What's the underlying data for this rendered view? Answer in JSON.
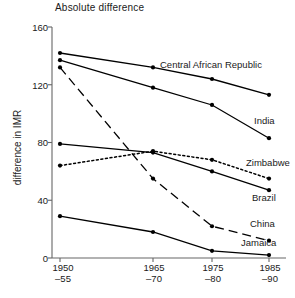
{
  "chart_data": {
    "type": "line",
    "title": "Absolute difference",
    "xlabel": "",
    "ylabel": "difference in IMR",
    "categories": [
      "1950–55",
      "1965–70",
      "1975–80",
      "1985–90"
    ],
    "category_lines": [
      [
        "1950",
        "–55"
      ],
      [
        "1965",
        "–70"
      ],
      [
        "1975",
        "–80"
      ],
      [
        "1985",
        "–90"
      ]
    ],
    "ylim": [
      0,
      160
    ],
    "yticks": [
      0,
      40,
      80,
      120,
      160
    ],
    "ytick_labels": [
      "0",
      "40",
      "80",
      "120",
      "160"
    ],
    "grid": false,
    "legend": "inline-right-labels",
    "series": [
      {
        "name": "Central African Republic",
        "values": [
          142,
          132,
          124,
          113
        ],
        "style": "solid",
        "color": "#000000",
        "label_position": "above-right"
      },
      {
        "name": "India",
        "values": [
          137,
          118,
          106,
          83
        ],
        "style": "solid",
        "color": "#000000",
        "label_position": "right"
      },
      {
        "name": "China",
        "values": [
          132,
          55,
          22,
          12
        ],
        "style": "dashed",
        "color": "#000000",
        "label_position": "right"
      },
      {
        "name": "Brazil",
        "values": [
          79,
          73,
          60,
          47
        ],
        "style": "solid",
        "color": "#000000",
        "label_position": "right"
      },
      {
        "name": "Zimbabwe",
        "values": [
          64,
          74,
          68,
          55
        ],
        "style": "dotted",
        "color": "#000000",
        "label_position": "right"
      },
      {
        "name": "Jamaica",
        "values": [
          29,
          18,
          5,
          2
        ],
        "style": "solid",
        "color": "#000000",
        "label_position": "right"
      }
    ]
  },
  "axis": {
    "y_title": "difference in IMR"
  }
}
